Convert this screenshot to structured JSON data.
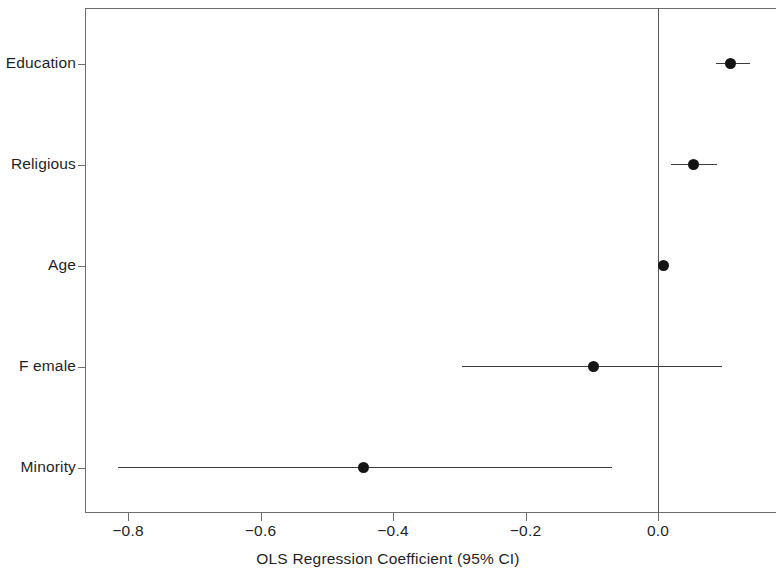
{
  "chart_data": {
    "type": "scatter",
    "subtype": "forest-plot",
    "title": "",
    "xlabel": "OLS Regression Coefficient (95% CI)",
    "ylabel": "",
    "xlim": [
      -0.865,
      0.178
    ],
    "xticks": [
      -0.8,
      -0.6,
      -0.4,
      -0.2,
      0.0
    ],
    "xticklabels": [
      "−0.8",
      "−0.6",
      "−0.4",
      "−0.2",
      "0.0"
    ],
    "categories": [
      "Education",
      "Religious",
      "Age",
      "Female",
      "Minority"
    ],
    "grid": false,
    "legend": false,
    "reference_line": 0.0,
    "marker": "filled-circle",
    "marker_color": "#141414",
    "line_color": "#3a3a3a",
    "axis_color": "#6e6e6e",
    "background": "#ffffff",
    "points": [
      {
        "label": "Education",
        "estimate": 0.11,
        "ci_low": 0.088,
        "ci_high": 0.139
      },
      {
        "label": "Religious",
        "estimate": 0.053,
        "ci_low": 0.02,
        "ci_high": 0.089
      },
      {
        "label": "Age",
        "estimate": 0.008,
        "ci_low": 0.002,
        "ci_high": 0.013
      },
      {
        "label": "Female",
        "estimate": -0.098,
        "ci_low": -0.296,
        "ci_high": 0.097
      },
      {
        "label": "Minority",
        "estimate": -0.444,
        "ci_low": -0.815,
        "ci_high": -0.069
      }
    ]
  },
  "axis": {
    "x_title": "OLS Regression Coefficient (95% CI)",
    "tick_labels": {
      "t0": "−0.8",
      "t1": "−0.6",
      "t2": "−0.4",
      "t3": "−0.2",
      "t4": "0.0"
    },
    "y_labels": {
      "r0": "Education",
      "r1": "Religious",
      "r2": "Age",
      "r3": "F emale",
      "r4": "Minority"
    }
  }
}
